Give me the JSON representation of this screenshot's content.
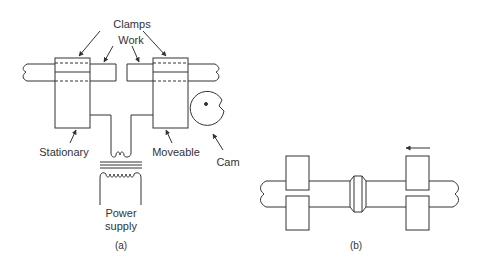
{
  "figure_a": {
    "labels": {
      "clamps": "Clamps",
      "work": "Work",
      "stationary": "Stationary",
      "moveable": "Moveable",
      "cam": "Cam",
      "power_supply_line1": "Power",
      "power_supply_line2": "supply",
      "caption": "(a)"
    }
  },
  "figure_b": {
    "labels": {
      "caption": "(b)"
    },
    "arrow_direction": "left"
  },
  "colors": {
    "stroke": "#333333",
    "background": "#ffffff"
  }
}
